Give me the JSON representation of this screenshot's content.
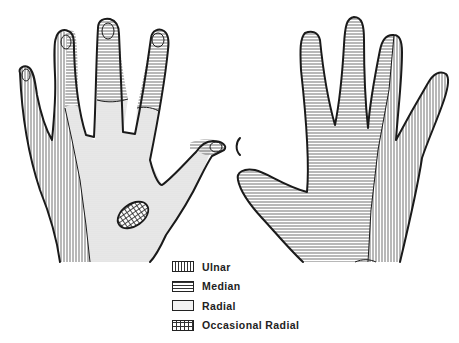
{
  "figure": {
    "views": [
      {
        "name": "dorsal",
        "label": ""
      },
      {
        "name": "palmar",
        "label": ""
      }
    ]
  },
  "legend": {
    "items": [
      {
        "key": "ulnar",
        "label": "Ulnar",
        "pattern": "vertical-lines"
      },
      {
        "key": "median",
        "label": "Median",
        "pattern": "horizontal-lines"
      },
      {
        "key": "radial",
        "label": "Radial",
        "pattern": "stipple"
      },
      {
        "key": "occasional_radial",
        "label": "Occasional Radial",
        "pattern": "crosshatch"
      }
    ]
  },
  "colors": {
    "ink": "#1a1a1a",
    "background": "#ffffff"
  }
}
